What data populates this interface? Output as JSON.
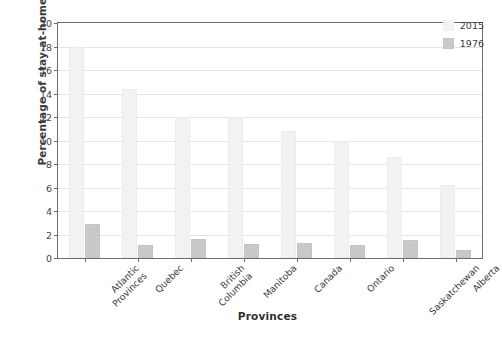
{
  "chart_data": {
    "type": "bar",
    "title": "",
    "subtitle": "",
    "xlabel": "Provinces",
    "ylabel": "Percentage of stay-at-home fathers",
    "ylim": [
      0,
      20
    ],
    "ytick_step": 2,
    "yticks": [
      "20",
      "18",
      "16",
      "14",
      "12",
      "10",
      "8",
      "6",
      "4",
      "2",
      "0"
    ],
    "grid": true,
    "legend_position": "top-right",
    "categories": [
      "Atlantic\nProvinces",
      "Quebec",
      "British\nColumbia",
      "Manitoba",
      "Canada",
      "Ontario",
      "Saskatchewan",
      "Alberta"
    ],
    "series": [
      {
        "name": "2015",
        "color": "#f2f2f2",
        "values": [
          18.0,
          14.4,
          12.0,
          12.0,
          10.8,
          10.0,
          8.6,
          6.2
        ]
      },
      {
        "name": "1976",
        "color": "#c9c9c9",
        "values": [
          2.9,
          1.1,
          1.6,
          1.2,
          1.3,
          1.1,
          1.5,
          0.7
        ]
      }
    ]
  },
  "legend": {
    "entries": [
      {
        "label": "2015",
        "swatch": "#f4f4f4"
      },
      {
        "label": "1976",
        "swatch": "#c9c9c9"
      }
    ]
  }
}
